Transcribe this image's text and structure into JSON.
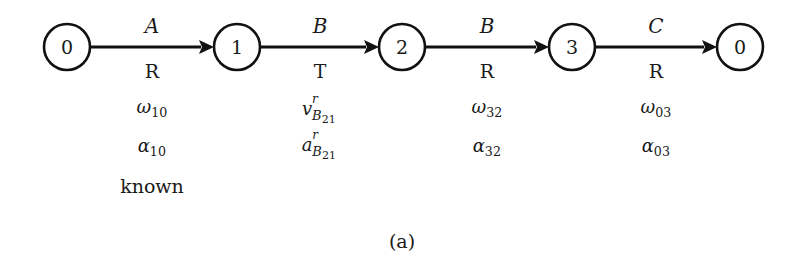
{
  "figure": {
    "caption": "(a)",
    "background_color": "#ffffff",
    "ink_color": "#111111"
  },
  "nodes": [
    {
      "id": "n0a",
      "label": "0",
      "cx": 67,
      "cy": 47,
      "r": 23
    },
    {
      "id": "n1",
      "label": "1",
      "cx": 237,
      "cy": 47,
      "r": 23
    },
    {
      "id": "n2",
      "label": "2",
      "cx": 402,
      "cy": 47,
      "r": 23
    },
    {
      "id": "n3",
      "label": "3",
      "cx": 572,
      "cy": 47,
      "r": 23
    },
    {
      "id": "n0b",
      "label": "0",
      "cx": 740,
      "cy": 47,
      "r": 23
    }
  ],
  "edges": [
    {
      "from": "0",
      "to": "1",
      "joint": "A",
      "joint_type": "R",
      "x1": 90,
      "x2": 214,
      "y": 47,
      "label_x": 112,
      "letter_y": 16,
      "type_y": 62,
      "quantities": [
        {
          "kind": "greek_sub",
          "base": "ω",
          "sub": "10"
        },
        {
          "kind": "greek_sub",
          "base": "α",
          "sub": "10"
        },
        {
          "kind": "word",
          "text": "known"
        }
      ],
      "qty_x": 97,
      "qty_y": 98
    },
    {
      "from": "1",
      "to": "2",
      "joint": "B",
      "joint_type": "T",
      "x1": 260,
      "x2": 379,
      "y": 47,
      "label_x": 280,
      "letter_y": 16,
      "type_y": 62,
      "quantities": [
        {
          "kind": "vec_sub_sup",
          "base": "v",
          "sup": "r",
          "sub_letter": "B",
          "sub_num": "21"
        },
        {
          "kind": "vec_sub_sup",
          "base": "a",
          "sup": "r",
          "sub_letter": "B",
          "sub_num": "21"
        }
      ],
      "qty_x": 265,
      "qty_y": 100
    },
    {
      "from": "2",
      "to": "3",
      "joint": "B",
      "joint_type": "R",
      "x1": 425,
      "x2": 549,
      "y": 47,
      "label_x": 447,
      "letter_y": 16,
      "type_y": 62,
      "quantities": [
        {
          "kind": "greek_sub",
          "base": "ω",
          "sub": "32"
        },
        {
          "kind": "greek_sub",
          "base": "α",
          "sub": "32"
        }
      ],
      "qty_x": 432,
      "qty_y": 98
    },
    {
      "from": "3",
      "to": "0",
      "joint": "C",
      "joint_type": "R",
      "x1": 595,
      "x2": 717,
      "y": 47,
      "label_x": 616,
      "letter_y": 16,
      "type_y": 62,
      "quantities": [
        {
          "kind": "greek_sub",
          "base": "ω",
          "sub": "03"
        },
        {
          "kind": "greek_sub",
          "base": "α",
          "sub": "03"
        }
      ],
      "qty_x": 601,
      "qty_y": 98
    }
  ],
  "caption_position": {
    "x": 0,
    "y": 232
  }
}
